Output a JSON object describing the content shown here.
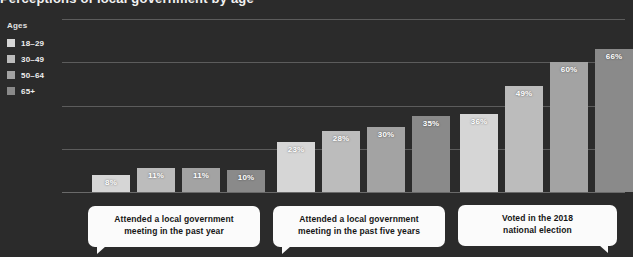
{
  "title": "Perceptions of local government by age",
  "legend": {
    "title": "Ages",
    "items": [
      {
        "label": "18–29",
        "color": "#d6d6d6"
      },
      {
        "label": "30–49",
        "color": "#bcbcbc"
      },
      {
        "label": "50–64",
        "color": "#a3a3a3"
      },
      {
        "label": "65+",
        "color": "#8a8a8a"
      }
    ]
  },
  "callouts": [
    {
      "line1": "Attended a local government",
      "line2": "meeting in the past year"
    },
    {
      "line1": "Attended a local government",
      "line2": "meeting in the past five years"
    },
    {
      "line1": "Voted in the 2018",
      "line2": "national election"
    }
  ],
  "chart_data": {
    "type": "bar",
    "title": "Perceptions of local government by age",
    "xlabel": "",
    "ylabel": "",
    "ylim": [
      0,
      80
    ],
    "grid": true,
    "gridlines": [
      0,
      20,
      40,
      60,
      80
    ],
    "legend_position": "top-left",
    "value_suffix": "%",
    "categories": [
      "Attended a local government meeting in the past year",
      "Attended a local government meeting in the past five years",
      "Voted in the 2018 national election"
    ],
    "series": [
      {
        "name": "18–29",
        "color": "#d6d6d6",
        "values": [
          8,
          23,
          36
        ]
      },
      {
        "name": "30–49",
        "color": "#bcbcbc",
        "values": [
          11,
          28,
          49
        ]
      },
      {
        "name": "50–64",
        "color": "#a3a3a3",
        "values": [
          11,
          30,
          60
        ]
      },
      {
        "name": "65+",
        "color": "#8a8a8a",
        "values": [
          10,
          35,
          66
        ]
      }
    ],
    "labels": [
      [
        "8%",
        "11%",
        "11%",
        "10%"
      ],
      [
        "23%",
        "28%",
        "30%",
        "35%"
      ],
      [
        "36%",
        "49%",
        "60%",
        "66%"
      ]
    ]
  },
  "layout": {
    "background": "#2b2b2b",
    "gridline_color": "#5c5c5c",
    "group_starts": [
      30,
      215,
      398
    ],
    "bar_width": 38,
    "bar_gap": 7
  }
}
